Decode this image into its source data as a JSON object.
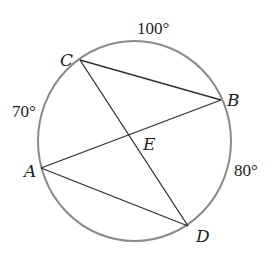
{
  "figure": {
    "type": "circle-with-intersecting-chords",
    "circle": {
      "cx": 134.5,
      "cy": 141,
      "rx": 96.5,
      "ry": 100,
      "stroke": "#8a8a8a"
    },
    "points": {
      "A": {
        "label": "A",
        "x": 41,
        "y": 168,
        "label_x": 24,
        "label_y": 177
      },
      "B": {
        "label": "B",
        "x": 221,
        "y": 100,
        "label_x": 227,
        "label_y": 106
      },
      "C": {
        "label": "C",
        "x": 80,
        "y": 60,
        "label_x": 60,
        "label_y": 66
      },
      "D": {
        "label": "D",
        "x": 188,
        "y": 226,
        "label_x": 196,
        "label_y": 242
      },
      "E": {
        "label": "E",
        "x": 130,
        "y": 135,
        "label_x": 143,
        "label_y": 150
      }
    },
    "chords": [
      {
        "from": "C",
        "to": "B"
      },
      {
        "from": "C",
        "to": "D"
      },
      {
        "from": "A",
        "to": "B"
      },
      {
        "from": "A",
        "to": "D"
      }
    ],
    "arc_labels": [
      {
        "arc": "CB",
        "text": "100°",
        "x": 137,
        "y": 34
      },
      {
        "arc": "CA",
        "text": "70°",
        "x": 12,
        "y": 117
      },
      {
        "arc": "BD",
        "text": "80°",
        "x": 234,
        "y": 176
      }
    ]
  }
}
